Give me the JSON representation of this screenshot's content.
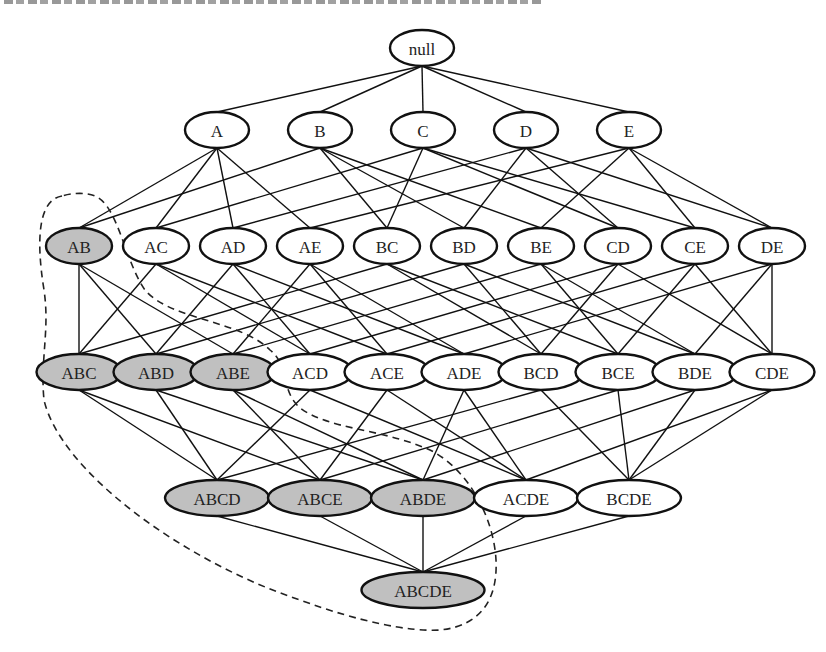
{
  "chart_data": {
    "type": "diagram",
    "title": "",
    "colors": {
      "shaded_fill": "#c0c0c0",
      "plain_fill": "#ffffff",
      "stroke": "#111111"
    },
    "levels": [
      {
        "y": 48,
        "nodes": [
          {
            "label": "null",
            "x": 422,
            "shaded": false
          }
        ]
      },
      {
        "y": 130,
        "nodes": [
          {
            "label": "A",
            "x": 217,
            "shaded": false
          },
          {
            "label": "B",
            "x": 320,
            "shaded": false
          },
          {
            "label": "C",
            "x": 423,
            "shaded": false
          },
          {
            "label": "D",
            "x": 526,
            "shaded": false
          },
          {
            "label": "E",
            "x": 629,
            "shaded": false
          }
        ]
      },
      {
        "y": 246,
        "nodes": [
          {
            "label": "AB",
            "x": 79,
            "shaded": true
          },
          {
            "label": "AC",
            "x": 156,
            "shaded": false
          },
          {
            "label": "AD",
            "x": 233,
            "shaded": false
          },
          {
            "label": "AE",
            "x": 310,
            "shaded": false
          },
          {
            "label": "BC",
            "x": 387,
            "shaded": false
          },
          {
            "label": "BD",
            "x": 464,
            "shaded": false
          },
          {
            "label": "BE",
            "x": 541,
            "shaded": false
          },
          {
            "label": "CD",
            "x": 618,
            "shaded": false
          },
          {
            "label": "CE",
            "x": 695,
            "shaded": false
          },
          {
            "label": "DE",
            "x": 772,
            "shaded": false
          }
        ]
      },
      {
        "y": 372,
        "nodes": [
          {
            "label": "ABC",
            "x": 79,
            "shaded": true
          },
          {
            "label": "ABD",
            "x": 156,
            "shaded": true
          },
          {
            "label": "ABE",
            "x": 233,
            "shaded": true
          },
          {
            "label": "ACD",
            "x": 310,
            "shaded": false
          },
          {
            "label": "ACE",
            "x": 387,
            "shaded": false
          },
          {
            "label": "ADE",
            "x": 464,
            "shaded": false
          },
          {
            "label": "BCD",
            "x": 541,
            "shaded": false
          },
          {
            "label": "BCE",
            "x": 618,
            "shaded": false
          },
          {
            "label": "BDE",
            "x": 695,
            "shaded": false
          },
          {
            "label": "CDE",
            "x": 772,
            "shaded": false
          }
        ]
      },
      {
        "y": 498,
        "nodes": [
          {
            "label": "ABCD",
            "x": 217,
            "shaded": true
          },
          {
            "label": "ABCE",
            "x": 320,
            "shaded": true
          },
          {
            "label": "ABDE",
            "x": 423,
            "shaded": true
          },
          {
            "label": "ACDE",
            "x": 526,
            "shaded": false
          },
          {
            "label": "BCDE",
            "x": 629,
            "shaded": false
          }
        ]
      },
      {
        "y": 590,
        "nodes": [
          {
            "label": "ABCDE",
            "x": 423,
            "shaded": true
          }
        ]
      }
    ],
    "edges_rule": "connect each node to nodes in the next level that are supersets with exactly one more item",
    "boundary": {
      "style": "dashed",
      "encloses": [
        "AB",
        "ABC",
        "ABD",
        "ABE",
        "ABCD",
        "ABCE",
        "ABDE",
        "ABCDE"
      ]
    }
  }
}
